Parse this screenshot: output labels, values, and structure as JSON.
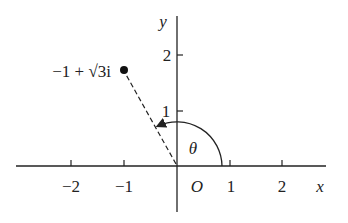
{
  "diagram": {
    "type": "argand-diagram",
    "axes": {
      "x_label": "x",
      "y_label": "y",
      "origin_label": "O",
      "x_ticks": [
        {
          "value": -2,
          "label": "−2"
        },
        {
          "value": -1,
          "label": "−1"
        },
        {
          "value": 1,
          "label": "1"
        },
        {
          "value": 2,
          "label": "2"
        }
      ],
      "y_ticks": [
        {
          "value": 1,
          "label": "1"
        },
        {
          "value": 2,
          "label": "2"
        }
      ]
    },
    "point": {
      "label": "−1 + √3i",
      "re": -1,
      "im": 1.732
    },
    "angle": {
      "label": "θ",
      "description": "arc from positive x-axis to line joining O and point"
    },
    "colors": {
      "ink": "#222222",
      "background": "#ffffff"
    }
  }
}
